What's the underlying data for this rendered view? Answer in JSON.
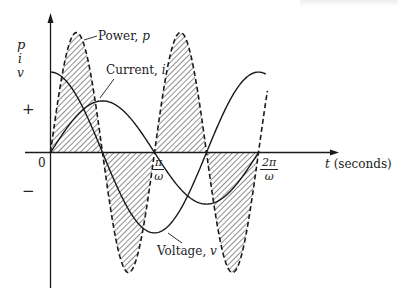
{
  "diagram": {
    "y_axis": {
      "labels": [
        "p",
        "i",
        "v"
      ],
      "positive_sign": "+",
      "negative_sign": "−"
    },
    "x_axis": {
      "label_var": "t",
      "label_unit": "(seconds)",
      "origin": "0",
      "ticks": [
        {
          "num": "π",
          "den": "ω"
        },
        {
          "num": "2π",
          "den": "ω"
        }
      ]
    },
    "curves": {
      "power": {
        "name": "Power",
        "var": "p",
        "style": "dashed, hatched fill",
        "color": "#1a1a1a"
      },
      "current": {
        "name": "Current",
        "var": "i",
        "style": "solid",
        "color": "#1a1a1a"
      },
      "voltage": {
        "name": "Voltage",
        "var": "v",
        "style": "solid",
        "color": "#1a1a1a"
      }
    },
    "labels": {
      "power": "Power, ",
      "current": "Current, ",
      "voltage": "Voltage, "
    }
  },
  "chart_data": {
    "type": "line",
    "title": "",
    "xlabel": "t (seconds)",
    "ylabel": "p, i, v",
    "x_ticks": [
      "0",
      "π/ω",
      "2π/ω"
    ],
    "x_range_wt_radians": [
      0,
      6.6
    ],
    "grid": false,
    "legend": "inline annotations",
    "series": [
      {
        "name": "Voltage, v",
        "function": "V·cos(ωt)",
        "relative_amplitude": 0.67
      },
      {
        "name": "Current, i",
        "function": "I·sin(ωt)",
        "relative_amplitude": 0.43
      },
      {
        "name": "Power, p",
        "function": "P·sin(2ωt)",
        "relative_amplitude": 1.0,
        "shaded": true
      }
    ],
    "key_points_wt": {
      "voltage_peaks": [
        0,
        6.283
      ],
      "voltage_min": 3.1416,
      "current_peak": 1.5708,
      "current_min": 4.712,
      "power_zero_crossings": [
        0,
        1.5708,
        3.1416,
        4.712,
        6.283
      ]
    }
  }
}
